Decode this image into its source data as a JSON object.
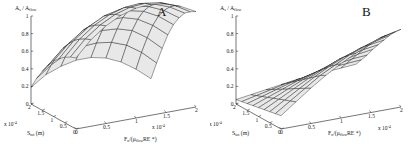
{
  "figure": {
    "background_color": "#ffffff",
    "line_color": "#1a1a1a",
    "face_color": "#e8e8e8",
    "panels": [
      {
        "letter": "A",
        "name": "panel-a",
        "zaxis": {
          "label_main": "A",
          "label_sub": "s",
          "label_sep": " / ",
          "label_main2": "A",
          "label_sub2": "flow",
          "ticks": [
            "0",
            "0.2",
            "0.4",
            "0.6",
            "0.8",
            "1"
          ],
          "range": [
            0,
            1
          ]
        },
        "depth_axis": {
          "label_main": "S",
          "label_sub": "tot",
          "label_unit": " (m)",
          "ticks": [
            "2",
            "1.5",
            "1",
            "0.5",
            "0"
          ],
          "multiplier": "x 10",
          "multiplier_exp": "-4",
          "range": [
            0,
            2
          ]
        },
        "horiz_axis": {
          "label_main": "F",
          "label_sub": "n",
          "label_mid": "/(",
          "label_mu": "μ",
          "label_mu_sub": "flow",
          "label_tail": "RE *)",
          "ticks": [
            "0",
            "0.5",
            "1",
            "1.5",
            "2"
          ],
          "multiplier": "x 10",
          "multiplier_exp": "-4",
          "range": [
            0,
            2
          ]
        }
      },
      {
        "letter": "B",
        "name": "panel-b",
        "zaxis": {
          "label_main": "A",
          "label_sub": "s",
          "label_sep": " / ",
          "label_main2": "A",
          "label_sub2": "flow",
          "ticks": [
            "0",
            "0.2",
            "0.4",
            "0.6",
            "0.8",
            "1"
          ],
          "range": [
            0,
            1
          ]
        },
        "depth_axis": {
          "label_main": "S",
          "label_sub": "tot",
          "label_unit": " (m)",
          "ticks": [
            "2",
            "1.5",
            "1",
            "0.5",
            "0"
          ],
          "multiplier": "x 10",
          "multiplier_exp": "-4",
          "range": [
            0,
            2
          ]
        },
        "horiz_axis": {
          "label_main": "F",
          "label_sub": "n",
          "label_mid": "/(",
          "label_mu": "μ",
          "label_mu_sub": "flow",
          "label_tail": "RE *)",
          "ticks": [
            "0",
            "0.5",
            "1",
            "1.5",
            "2"
          ],
          "multiplier": "x 10",
          "multiplier_exp": "-4",
          "range": [
            0,
            2
          ]
        }
      }
    ]
  },
  "chart_data": [
    {
      "type": "surface",
      "panel": "A",
      "title": "A",
      "xlabel": "F_n/(μ_flow RE *)",
      "ylabel": "S_tot (m)",
      "zlabel": "A_s / A_flow",
      "xlim": [
        0,
        0.0002
      ],
      "ylim": [
        0,
        0.0002
      ],
      "zlim": [
        0,
        1
      ],
      "x_ticks": [
        0,
        0.5,
        1,
        1.5,
        2
      ],
      "y_ticks": [
        0,
        0.5,
        1,
        1.5,
        2
      ],
      "z_ticks": [
        0,
        0.2,
        0.4,
        0.6,
        0.8,
        1
      ],
      "x_multiplier": 0.0001,
      "y_multiplier": 0.0001,
      "grid": false,
      "legend": false,
      "description": "Arched dome surface rising steeply to a ridge near z=1 and falling off toward the front-right corner.",
      "x": [
        0,
        0.25,
        0.5,
        0.75,
        1.0,
        1.25,
        1.5,
        1.75,
        2.0
      ],
      "y": [
        0,
        0.25,
        0.5,
        0.75,
        1.0,
        1.25,
        1.5,
        1.75,
        2.0
      ],
      "z": [
        [
          0.64,
          0.78,
          0.88,
          0.95,
          0.99,
          1.0,
          0.98,
          0.93,
          0.86
        ],
        [
          0.62,
          0.76,
          0.86,
          0.93,
          0.97,
          0.98,
          0.96,
          0.91,
          0.83
        ],
        [
          0.59,
          0.73,
          0.83,
          0.9,
          0.94,
          0.95,
          0.92,
          0.87,
          0.79
        ],
        [
          0.55,
          0.69,
          0.79,
          0.86,
          0.89,
          0.9,
          0.87,
          0.81,
          0.72
        ],
        [
          0.5,
          0.63,
          0.73,
          0.79,
          0.83,
          0.83,
          0.8,
          0.73,
          0.63
        ],
        [
          0.43,
          0.56,
          0.65,
          0.71,
          0.74,
          0.74,
          0.7,
          0.62,
          0.51
        ],
        [
          0.35,
          0.47,
          0.55,
          0.6,
          0.62,
          0.61,
          0.57,
          0.48,
          0.36
        ],
        [
          0.26,
          0.36,
          0.43,
          0.47,
          0.48,
          0.46,
          0.41,
          0.32,
          0.2
        ],
        [
          0.15,
          0.24,
          0.29,
          0.32,
          0.32,
          0.29,
          0.23,
          0.14,
          0.03
        ]
      ]
    },
    {
      "type": "surface",
      "panel": "B",
      "title": "B",
      "xlabel": "F_n/(μ_flow RE *)",
      "ylabel": "S_tot (m)",
      "zlabel": "A_s / A_flow",
      "xlim": [
        0,
        0.0002
      ],
      "ylim": [
        0,
        0.0002
      ],
      "zlim": [
        0,
        1
      ],
      "x_ticks": [
        0,
        0.5,
        1,
        1.5,
        2
      ],
      "y_ticks": [
        0,
        0.5,
        1,
        1.5,
        2
      ],
      "z_ticks": [
        0,
        0.2,
        0.4,
        0.6,
        0.8,
        1
      ],
      "x_multiplier": 0.0001,
      "y_multiplier": 0.0001,
      "grid": false,
      "legend": false,
      "description": "Low, gently inclined sheet rising monotonically from near 0.05 at the front to about 0.70 at the back corner.",
      "x": [
        0,
        0.25,
        0.5,
        0.75,
        1.0,
        1.25,
        1.5,
        1.75,
        2.0
      ],
      "y": [
        0,
        0.25,
        0.5,
        0.75,
        1.0,
        1.25,
        1.5,
        1.75,
        2.0
      ],
      "z": [
        [
          0.12,
          0.22,
          0.32,
          0.41,
          0.49,
          0.56,
          0.62,
          0.67,
          0.7
        ],
        [
          0.11,
          0.2,
          0.29,
          0.38,
          0.45,
          0.52,
          0.57,
          0.62,
          0.65
        ],
        [
          0.1,
          0.18,
          0.26,
          0.34,
          0.41,
          0.47,
          0.52,
          0.56,
          0.59
        ],
        [
          0.09,
          0.16,
          0.23,
          0.3,
          0.36,
          0.42,
          0.46,
          0.5,
          0.52
        ],
        [
          0.08,
          0.14,
          0.2,
          0.26,
          0.31,
          0.36,
          0.4,
          0.43,
          0.45
        ],
        [
          0.07,
          0.12,
          0.17,
          0.22,
          0.26,
          0.3,
          0.33,
          0.36,
          0.38
        ],
        [
          0.06,
          0.1,
          0.14,
          0.18,
          0.21,
          0.24,
          0.27,
          0.29,
          0.3
        ],
        [
          0.05,
          0.08,
          0.11,
          0.14,
          0.16,
          0.19,
          0.21,
          0.22,
          0.23
        ],
        [
          0.04,
          0.06,
          0.08,
          0.1,
          0.12,
          0.13,
          0.14,
          0.15,
          0.16
        ]
      ]
    }
  ]
}
